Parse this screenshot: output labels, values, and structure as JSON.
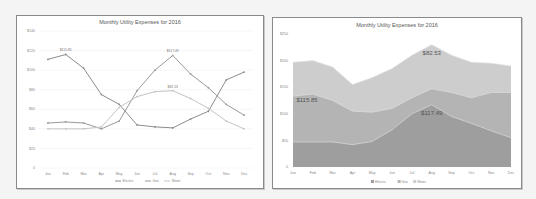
{
  "chart_data": [
    {
      "type": "line",
      "title": "Monthly Utility Expenses for 2016",
      "xlabel": "",
      "ylabel": "",
      "categories": [
        "Jan",
        "Feb",
        "Mar",
        "Apr",
        "May",
        "Jun",
        "Jul",
        "Aug",
        "Sep",
        "Oct",
        "Nov",
        "Dec"
      ],
      "y_ticks": [
        "$140",
        "$120",
        "$100",
        "$80",
        "$60",
        "$40",
        "$20",
        "0"
      ],
      "ylim": [
        0,
        140
      ],
      "grid": true,
      "legend_position": "bottom",
      "series": [
        {
          "name": "Electric",
          "color": "#8c8c8c",
          "values": [
            111,
            116,
            102,
            75,
            65,
            44,
            42,
            41,
            50,
            58,
            90,
            98
          ],
          "peak_label": "$115.85"
        },
        {
          "name": "Gas",
          "color": "#9a9a9a",
          "values": [
            46,
            47,
            46,
            40,
            48,
            79,
            100,
            115,
            96,
            82,
            65,
            54
          ],
          "peak_label": "$117.49"
        },
        {
          "name": "Water",
          "color": "#c4c4c4",
          "values": [
            40,
            40,
            40,
            42,
            62,
            73,
            78,
            79,
            71,
            61,
            48,
            40
          ],
          "peak_label": "$82.53"
        }
      ]
    },
    {
      "type": "area",
      "stacked": true,
      "title": "Monthly Utility Expenses for 2016",
      "categories": [
        "Jan",
        "Feb",
        "Mar",
        "Apr",
        "May",
        "Jun",
        "Jul",
        "Aug",
        "Sep",
        "Oct",
        "Nov",
        "Dec"
      ],
      "y_ticks": [
        "$250",
        "$200",
        "$150",
        "$100",
        "$50",
        "0"
      ],
      "ylim": [
        0,
        250
      ],
      "legend_position": "bottom",
      "series": [
        {
          "name": "Electric",
          "color": "#9e9e9e",
          "values": [
            47,
            47,
            47,
            42,
            48,
            70,
            100,
            117,
            95,
            82,
            68,
            55
          ],
          "label": "$117.49"
        },
        {
          "name": "Gas",
          "color": "#b4b4b4",
          "values": [
            86,
            90,
            78,
            63,
            55,
            40,
            30,
            30,
            45,
            48,
            72,
            85
          ],
          "label": "$115.85"
        },
        {
          "name": "Water",
          "color": "#cdcdcd",
          "values": [
            64,
            63,
            63,
            50,
            65,
            75,
            80,
            83,
            70,
            67,
            55,
            50
          ],
          "label": "$82.53"
        }
      ]
    }
  ],
  "left": {
    "title": "Monthly Utility Expenses for 2016",
    "legend": [
      "Electric",
      "Gas",
      "Water"
    ]
  },
  "right": {
    "title": "Monthly Utility Expenses for 2016",
    "legend": [
      "Electric",
      "Gas",
      "Water"
    ]
  }
}
